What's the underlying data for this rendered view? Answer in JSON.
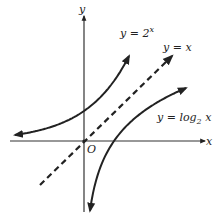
{
  "chart_data": {
    "type": "line",
    "title": "",
    "xlabel": "x",
    "ylabel": "y",
    "origin_label": "O",
    "grid": false,
    "xlim": [
      -2.5,
      4.0
    ],
    "ylim": [
      -2.3,
      4.2
    ],
    "series": [
      {
        "name": "y = 2^x",
        "label_lhs": "y = 2",
        "label_exp": "x",
        "style": "solid",
        "x": [
          -2.3,
          -2,
          -1.5,
          -1,
          -0.5,
          0,
          0.5,
          1,
          1.5
        ],
        "values": [
          0.2,
          0.25,
          0.35,
          0.5,
          0.71,
          1,
          1.41,
          2,
          2.83
        ]
      },
      {
        "name": "y = x",
        "label_lhs": "y = x",
        "style": "dashed",
        "x": [
          -1.5,
          3
        ],
        "values": [
          -1.5,
          3
        ]
      },
      {
        "name": "y = log2 x",
        "label_lhs": "y = log",
        "label_sub": "2",
        "label_rhs": " x",
        "style": "solid",
        "x": [
          0.2,
          0.35,
          0.5,
          0.71,
          1,
          1.41,
          2,
          2.83,
          3.4
        ],
        "values": [
          -2.32,
          -1.51,
          -1,
          -0.5,
          0,
          0.5,
          1,
          1.5,
          1.77
        ]
      }
    ],
    "axes": {
      "x_label": "x",
      "y_label": "y",
      "origin": "O"
    }
  },
  "labels": {
    "y_axis": "y",
    "x_axis": "x",
    "origin": "O",
    "exp_lhs": "y = 2",
    "exp_sup": "x",
    "line_lbl": "y = x",
    "log_lhs": "y = log",
    "log_sub": "2",
    "log_rhs": " x"
  }
}
